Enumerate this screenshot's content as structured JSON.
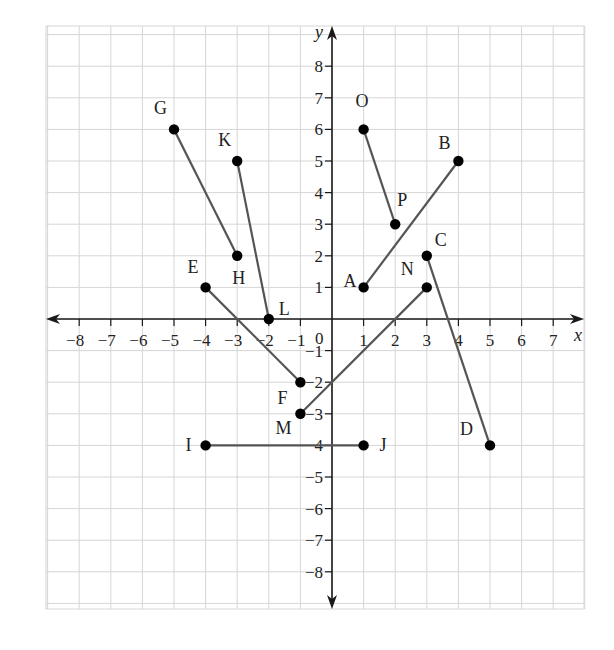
{
  "chart_data": {
    "type": "scatter",
    "title": "",
    "xlabel": "x",
    "ylabel": "y",
    "xlim": [
      -9,
      8
    ],
    "ylim": [
      -9,
      9
    ],
    "grid": true,
    "x_ticks": [
      -8,
      -7,
      -6,
      -5,
      -4,
      -3,
      -2,
      -1,
      1,
      2,
      3,
      4,
      5,
      6,
      7
    ],
    "y_ticks": [
      -8,
      -7,
      -6,
      -5,
      -4,
      -3,
      -2,
      -1,
      1,
      2,
      3,
      4,
      5,
      6,
      7,
      8
    ],
    "origin_label": "0",
    "points": [
      {
        "name": "A",
        "x": 1,
        "y": 1
      },
      {
        "name": "B",
        "x": 4,
        "y": 5
      },
      {
        "name": "C",
        "x": 3,
        "y": 2
      },
      {
        "name": "D",
        "x": 5,
        "y": -4
      },
      {
        "name": "E",
        "x": -4,
        "y": 1
      },
      {
        "name": "F",
        "x": -1,
        "y": -2
      },
      {
        "name": "G",
        "x": -5,
        "y": 6
      },
      {
        "name": "H",
        "x": -3,
        "y": 2
      },
      {
        "name": "I",
        "x": -4,
        "y": -4
      },
      {
        "name": "J",
        "x": 1,
        "y": -4
      },
      {
        "name": "K",
        "x": -3,
        "y": 5
      },
      {
        "name": "L",
        "x": -2,
        "y": 0
      },
      {
        "name": "M",
        "x": -1,
        "y": -3
      },
      {
        "name": "N",
        "x": 3,
        "y": 1
      },
      {
        "name": "O",
        "x": 1,
        "y": 6
      },
      {
        "name": "P",
        "x": 2,
        "y": 3
      }
    ],
    "segments": [
      {
        "from": "A",
        "to": "B"
      },
      {
        "from": "C",
        "to": "D"
      },
      {
        "from": "E",
        "to": "F"
      },
      {
        "from": "G",
        "to": "H"
      },
      {
        "from": "I",
        "to": "J"
      },
      {
        "from": "K",
        "to": "L"
      },
      {
        "from": "M",
        "to": "N"
      },
      {
        "from": "O",
        "to": "P"
      }
    ]
  },
  "style": {
    "grid_color": "#d6d6d6",
    "axis_color": "#1a1a1a",
    "segment_color": "#555555",
    "point_color": "#000000"
  }
}
